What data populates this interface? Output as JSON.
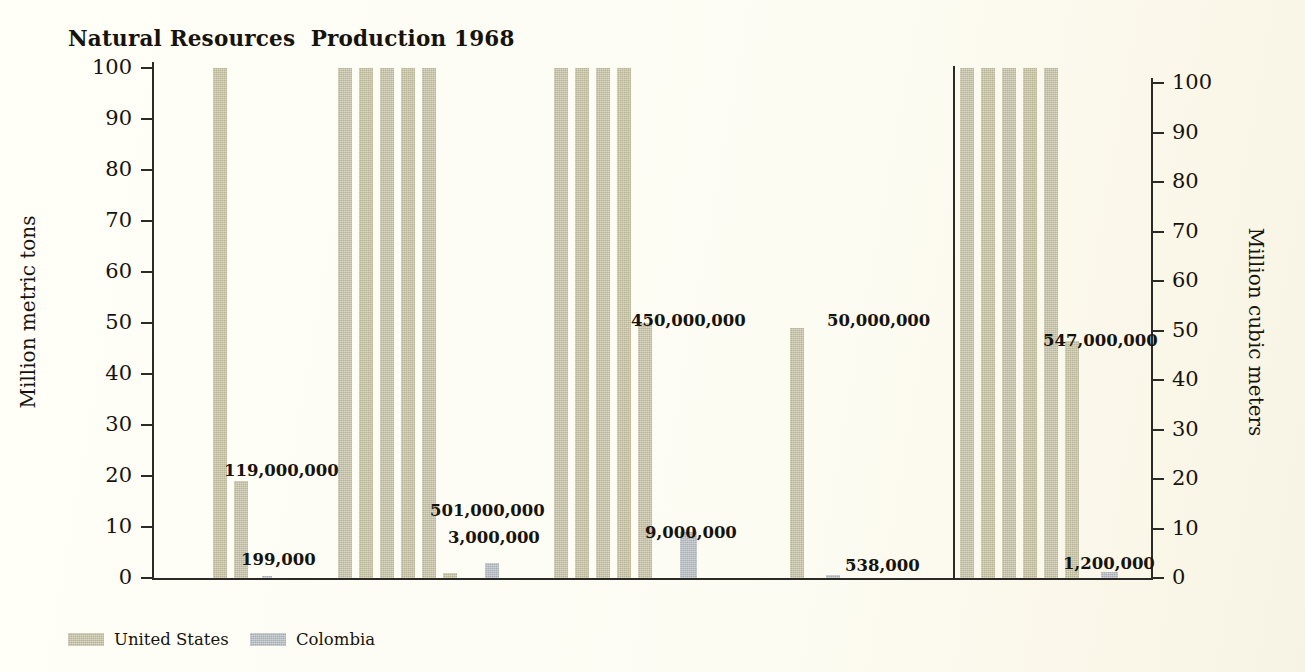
{
  "chart_data": {
    "type": "bar",
    "title": "Natural Resources  Production 1968",
    "xlabel": "",
    "ylabel": "Million metric tons",
    "y2label": "Million cubic meters",
    "ylim": [
      0,
      100
    ],
    "y2lim": [
      0,
      100
    ],
    "grid": false,
    "legend_position": "bottom-left",
    "bar_unit_note": "Each full-height bar segment represents 100 million units; values above 100 million are drawn as repeated full bars plus a partial bar.",
    "categories": [
      "Steel",
      "Coal",
      "Oil",
      "Iron ore",
      "Natural gas"
    ],
    "tick_labels_left": [
      "100",
      "90",
      "80",
      "70",
      "60",
      "50",
      "40",
      "30",
      "20",
      "10",
      "0"
    ],
    "tick_labels_right": [
      "100",
      "90",
      "80",
      "70",
      "60",
      "50",
      "40",
      "30",
      "20",
      "10",
      "0"
    ],
    "tick_values": [
      100,
      90,
      80,
      70,
      60,
      50,
      40,
      30,
      20,
      10,
      0
    ],
    "series": [
      {
        "name": "United States",
        "color": "#b8b393",
        "values": [
          119000000,
          501000000,
          450000000,
          50000000,
          547000000
        ],
        "value_labels": [
          "119,000,000",
          "501,000,000",
          "450,000,000",
          "50,000,000",
          "547,000,000"
        ],
        "full_bars": [
          1,
          5,
          4,
          0,
          5
        ],
        "partial_bar_height": [
          19,
          1,
          50,
          49,
          46.5
        ]
      },
      {
        "name": "Colombia",
        "color": "#a7adb4",
        "values": [
          199000,
          3000000,
          9000000,
          538000,
          1200000
        ],
        "value_labels": [
          "199,000",
          "3,000,000",
          "9,000,000",
          "538,000",
          "1,200,000"
        ],
        "full_bars": [
          0,
          0,
          0,
          0,
          0
        ],
        "partial_bar_height": [
          0.2,
          3.0,
          9.0,
          0.55,
          1.2
        ]
      }
    ]
  },
  "title": "Natural Resources  Production 1968",
  "axes": {
    "left_title": "Million metric tons",
    "right_title": "Million cubic meters",
    "ticks": [
      "100",
      "90",
      "80",
      "70",
      "60",
      "50",
      "40",
      "30",
      "20",
      "10",
      "0"
    ]
  },
  "categories": [
    {
      "label": "Steel"
    },
    {
      "label": "Coal"
    },
    {
      "label": "Oil"
    },
    {
      "label": "Iron ore"
    },
    {
      "label": "Natural gas"
    }
  ],
  "value_labels": {
    "steel_us": "119,000,000",
    "steel_co": "199,000",
    "coal_us": "501,000,000",
    "coal_co": "3,000,000",
    "oil_us": "450,000,000",
    "oil_co": "9,000,000",
    "iron_us": "50,000,000",
    "iron_co": "538,000",
    "gas_us": "547,000,000",
    "gas_co": "1,200,000"
  },
  "legend": {
    "items": [
      {
        "label": "United States",
        "color": "#b8b393"
      },
      {
        "label": "Colombia",
        "color": "#a7adb4"
      }
    ]
  },
  "colors": {
    "background": "#fdfbf0",
    "ink": "#16130c",
    "united_states": "#b8b393",
    "colombia": "#a7adb4"
  }
}
